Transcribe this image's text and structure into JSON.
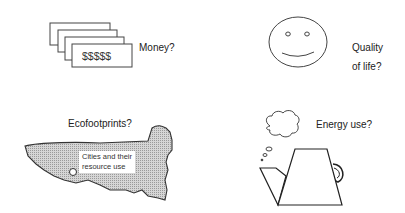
{
  "diagram": {
    "panels": [
      {
        "id": "money",
        "label": "Money?",
        "icon": "banknotes-icon",
        "note_text": "$$$$$"
      },
      {
        "id": "quality",
        "label_line1": "Quality",
        "label_line2": "of life?",
        "icon": "smiley-face-icon"
      },
      {
        "id": "ecofootprint",
        "label": "Ecofootprints?",
        "icon": "land-area-icon",
        "inner_label_line1": "Cities and their",
        "inner_label_line2": "resource use"
      },
      {
        "id": "energy",
        "label": "Energy use?",
        "icon": "kettle-icon",
        "secondary_icon": "steam-cloud-icon"
      }
    ],
    "colors": {
      "stroke": "#333333",
      "fill_area": "#c8c8c8",
      "background": "#ffffff"
    }
  }
}
